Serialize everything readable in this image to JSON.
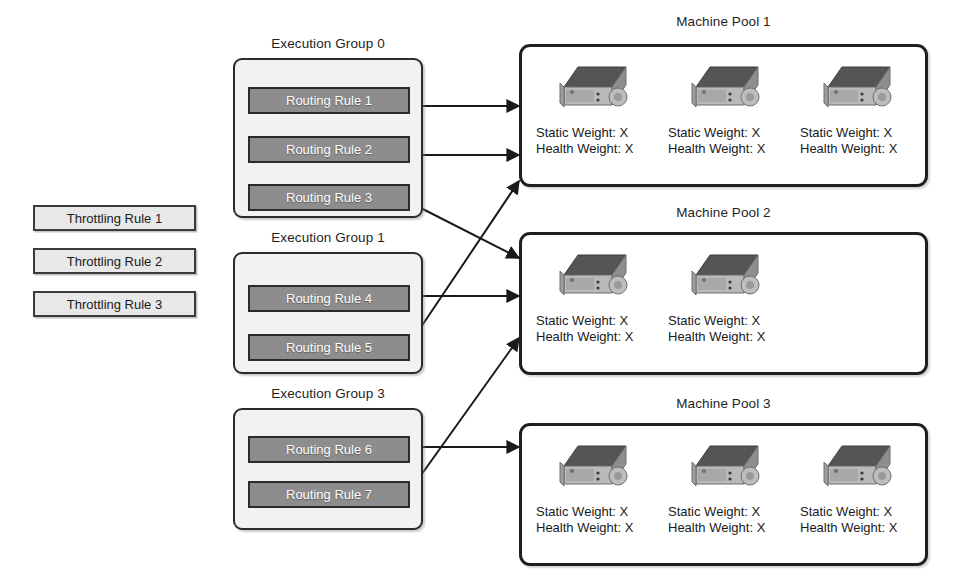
{
  "diagram": {
    "colors": {
      "routing_rule_fill": "#8d8d8d",
      "routing_rule_text": "#ffffff",
      "throttling_rule_fill": "#e8e8e8",
      "group_fill": "#f2f2f2",
      "border": "#2b2b2b",
      "pool_border": "#1f1f1f",
      "arrow": "#1a1a1a",
      "server_top": "#555555",
      "server_front": "#b9b9b9",
      "server_side": "#8e8e8e"
    }
  },
  "throttling_rules": [
    {
      "label": "Throttling Rule 1"
    },
    {
      "label": "Throttling Rule 2"
    },
    {
      "label": "Throttling Rule 3"
    }
  ],
  "execution_groups": [
    {
      "caption": "Execution Group 0",
      "rules": [
        {
          "label": "Routing Rule 1",
          "target_pool": "Machine Pool 1"
        },
        {
          "label": "Routing Rule 2",
          "target_pool": "Machine Pool 1"
        },
        {
          "label": "Routing Rule 3",
          "target_pool": "Machine Pool 2"
        }
      ]
    },
    {
      "caption": "Execution Group 1",
      "rules": [
        {
          "label": "Routing Rule 4",
          "target_pool": "Machine Pool 2"
        },
        {
          "label": "Routing Rule 5",
          "target_pool": "Machine Pool 1"
        }
      ]
    },
    {
      "caption": "Execution Group 3",
      "rules": [
        {
          "label": "Routing Rule 6",
          "target_pool": "Machine Pool 3"
        },
        {
          "label": "Routing Rule 7",
          "target_pool": "Machine Pool 2"
        }
      ]
    }
  ],
  "machine_pools": [
    {
      "caption": "Machine Pool 1",
      "machines": [
        {
          "icon": "server-icon",
          "static_weight": "Static Weight: X",
          "health_weight": "Health Weight: X"
        },
        {
          "icon": "server-icon",
          "static_weight": "Static Weight: X",
          "health_weight": "Health Weight: X"
        },
        {
          "icon": "server-icon",
          "static_weight": "Static Weight: X",
          "health_weight": "Health Weight: X"
        }
      ]
    },
    {
      "caption": "Machine Pool 2",
      "machines": [
        {
          "icon": "server-icon",
          "static_weight": "Static Weight: X",
          "health_weight": "Health Weight: X"
        },
        {
          "icon": "server-icon",
          "static_weight": "Static Weight: X",
          "health_weight": "Health Weight: X"
        }
      ]
    },
    {
      "caption": "Machine Pool 3",
      "machines": [
        {
          "icon": "server-icon",
          "static_weight": "Static Weight: X",
          "health_weight": "Health Weight: X"
        },
        {
          "icon": "server-icon",
          "static_weight": "Static Weight: X",
          "health_weight": "Health Weight: X"
        },
        {
          "icon": "server-icon",
          "static_weight": "Static Weight: X",
          "health_weight": "Health Weight: X"
        }
      ]
    }
  ],
  "connections": [
    {
      "from": "Routing Rule 1",
      "to": "Machine Pool 1"
    },
    {
      "from": "Routing Rule 2",
      "to": "Machine Pool 1"
    },
    {
      "from": "Routing Rule 3",
      "to": "Machine Pool 2"
    },
    {
      "from": "Routing Rule 4",
      "to": "Machine Pool 2"
    },
    {
      "from": "Routing Rule 5",
      "to": "Machine Pool 1"
    },
    {
      "from": "Routing Rule 6",
      "to": "Machine Pool 3"
    },
    {
      "from": "Routing Rule 7",
      "to": "Machine Pool 2"
    }
  ]
}
